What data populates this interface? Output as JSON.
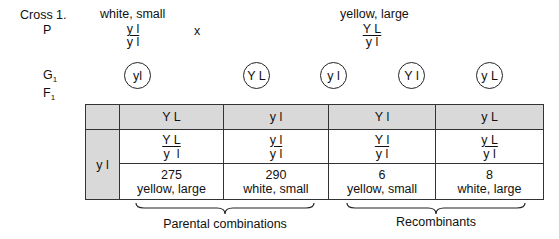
{
  "cross": {
    "title": "Cross 1.",
    "labels": {
      "p": "P",
      "g1_main": "G",
      "g1_sub": "1",
      "f1_main": "F",
      "f1_sub": "1"
    },
    "cross_symbol": "x",
    "parent1": {
      "phenotype": "white, small",
      "genotype_top": "y l",
      "genotype_bottom": "y l"
    },
    "parent2": {
      "phenotype": "yellow, large",
      "genotype_top": "Y L",
      "genotype_bottom": "y l"
    }
  },
  "gametes": [
    {
      "label": "yl",
      "parent": 1
    },
    {
      "label": "Y L",
      "parent": 2
    },
    {
      "label": "y l",
      "parent": 2
    },
    {
      "label": "Y l",
      "parent": 2
    },
    {
      "label": "y L",
      "parent": 2
    }
  ],
  "table": {
    "row_header": "y l",
    "columns": [
      {
        "gamete": "Y L",
        "genotype_top": "Y L",
        "genotype_bottom": "y  l",
        "count": "275",
        "phenotype": "yellow, large"
      },
      {
        "gamete": "y l",
        "genotype_top": "y l",
        "genotype_bottom": "y l",
        "count": "290",
        "phenotype": "white, small"
      },
      {
        "gamete": "Y l",
        "genotype_top": "Y l",
        "genotype_bottom": "y l",
        "count": "6",
        "phenotype": "yellow, small"
      },
      {
        "gamete": "y L",
        "genotype_top": "y L",
        "genotype_bottom": "y l",
        "count": "8",
        "phenotype": "white, large"
      }
    ]
  },
  "groups": {
    "parental": "Parental combinations",
    "recombinant": "Recombinants"
  },
  "colors": {
    "header_fill": "#d9d9d9",
    "line": "#333333"
  }
}
